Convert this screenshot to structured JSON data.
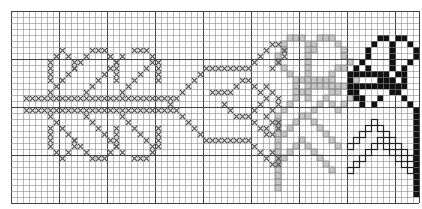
{
  "grid": {
    "cols": 68,
    "rows": 32,
    "cell": 6,
    "bold_every": 8,
    "line_color": "#8a8a8a",
    "bold_color": "#444444",
    "bg": "#ffffff"
  },
  "colors": {
    "cross": "#555555",
    "gray_fill": "#c8c8c8",
    "gray_dark": "#8c8c8c",
    "black": "#111111",
    "outline": "#222222"
  },
  "chart_data": {
    "type": "pattern-grid",
    "title": "",
    "cross_cells": [
      [
        2,
        14
      ],
      [
        3,
        14
      ],
      [
        4,
        14
      ],
      [
        5,
        14
      ],
      [
        6,
        14
      ],
      [
        7,
        14
      ],
      [
        8,
        14
      ],
      [
        9,
        14
      ],
      [
        10,
        14
      ],
      [
        11,
        14
      ],
      [
        12,
        14
      ],
      [
        13,
        14
      ],
      [
        14,
        14
      ],
      [
        15,
        14
      ],
      [
        16,
        14
      ],
      [
        17,
        14
      ],
      [
        18,
        14
      ],
      [
        19,
        14
      ],
      [
        20,
        14
      ],
      [
        21,
        14
      ],
      [
        22,
        14
      ],
      [
        23,
        14
      ],
      [
        24,
        14
      ],
      [
        25,
        14
      ],
      [
        26,
        14
      ],
      [
        2,
        16
      ],
      [
        3,
        16
      ],
      [
        4,
        16
      ],
      [
        5,
        16
      ],
      [
        6,
        16
      ],
      [
        7,
        16
      ],
      [
        8,
        16
      ],
      [
        9,
        16
      ],
      [
        10,
        16
      ],
      [
        11,
        16
      ],
      [
        12,
        16
      ],
      [
        13,
        16
      ],
      [
        14,
        16
      ],
      [
        15,
        16
      ],
      [
        16,
        16
      ],
      [
        17,
        16
      ],
      [
        18,
        16
      ],
      [
        19,
        16
      ],
      [
        20,
        16
      ],
      [
        21,
        16
      ],
      [
        22,
        16
      ],
      [
        23,
        16
      ],
      [
        24,
        16
      ],
      [
        25,
        16
      ],
      [
        26,
        16
      ],
      [
        6,
        13
      ],
      [
        7,
        12
      ],
      [
        8,
        11
      ],
      [
        9,
        10
      ],
      [
        10,
        9
      ],
      [
        11,
        8
      ],
      [
        12,
        7
      ],
      [
        6,
        17
      ],
      [
        7,
        18
      ],
      [
        8,
        19
      ],
      [
        9,
        20
      ],
      [
        10,
        21
      ],
      [
        11,
        22
      ],
      [
        12,
        23
      ],
      [
        6,
        9
      ],
      [
        6,
        10
      ],
      [
        6,
        11
      ],
      [
        6,
        8
      ],
      [
        7,
        7
      ],
      [
        8,
        6
      ],
      [
        9,
        7
      ],
      [
        10,
        8
      ],
      [
        10,
        9
      ],
      [
        6,
        19
      ],
      [
        6,
        20
      ],
      [
        6,
        21
      ],
      [
        6,
        22
      ],
      [
        7,
        23
      ],
      [
        8,
        24
      ],
      [
        9,
        23
      ],
      [
        10,
        22
      ],
      [
        10,
        21
      ],
      [
        12,
        13
      ],
      [
        13,
        12
      ],
      [
        14,
        11
      ],
      [
        15,
        10
      ],
      [
        16,
        9
      ],
      [
        17,
        8
      ],
      [
        18,
        7
      ],
      [
        12,
        17
      ],
      [
        13,
        18
      ],
      [
        14,
        19
      ],
      [
        15,
        20
      ],
      [
        16,
        21
      ],
      [
        17,
        22
      ],
      [
        18,
        23
      ],
      [
        13,
        6
      ],
      [
        14,
        6
      ],
      [
        15,
        6
      ],
      [
        16,
        7
      ],
      [
        17,
        8
      ],
      [
        17,
        9
      ],
      [
        17,
        10
      ],
      [
        17,
        11
      ],
      [
        13,
        24
      ],
      [
        14,
        24
      ],
      [
        15,
        24
      ],
      [
        16,
        23
      ],
      [
        17,
        22
      ],
      [
        17,
        21
      ],
      [
        17,
        20
      ],
      [
        17,
        19
      ],
      [
        18,
        13
      ],
      [
        19,
        12
      ],
      [
        20,
        11
      ],
      [
        21,
        10
      ],
      [
        22,
        9
      ],
      [
        23,
        8
      ],
      [
        18,
        17
      ],
      [
        19,
        18
      ],
      [
        20,
        19
      ],
      [
        21,
        20
      ],
      [
        22,
        21
      ],
      [
        23,
        22
      ],
      [
        20,
        6
      ],
      [
        21,
        6
      ],
      [
        22,
        6
      ],
      [
        23,
        7
      ],
      [
        24,
        8
      ],
      [
        24,
        9
      ],
      [
        24,
        10
      ],
      [
        24,
        11
      ],
      [
        20,
        24
      ],
      [
        21,
        24
      ],
      [
        22,
        24
      ],
      [
        23,
        23
      ],
      [
        24,
        22
      ],
      [
        24,
        21
      ],
      [
        24,
        20
      ],
      [
        24,
        19
      ],
      [
        26,
        15
      ],
      [
        27,
        14
      ],
      [
        28,
        13
      ],
      [
        29,
        12
      ],
      [
        30,
        11
      ],
      [
        31,
        10
      ],
      [
        32,
        9
      ],
      [
        27,
        16
      ],
      [
        28,
        17
      ],
      [
        29,
        18
      ],
      [
        30,
        19
      ],
      [
        31,
        20
      ],
      [
        32,
        21
      ],
      [
        33,
        9
      ],
      [
        34,
        9
      ],
      [
        35,
        9
      ],
      [
        36,
        9
      ],
      [
        37,
        9
      ],
      [
        38,
        9
      ],
      [
        39,
        9
      ],
      [
        40,
        8
      ],
      [
        41,
        7
      ],
      [
        42,
        6
      ],
      [
        43,
        5
      ],
      [
        44,
        5
      ],
      [
        45,
        6
      ],
      [
        45,
        7
      ],
      [
        44,
        8
      ],
      [
        43,
        9
      ],
      [
        33,
        21
      ],
      [
        34,
        21
      ],
      [
        35,
        21
      ],
      [
        36,
        21
      ],
      [
        37,
        21
      ],
      [
        38,
        21
      ],
      [
        39,
        21
      ],
      [
        40,
        22
      ],
      [
        41,
        23
      ],
      [
        42,
        24
      ],
      [
        43,
        25
      ],
      [
        44,
        25
      ],
      [
        44,
        24
      ],
      [
        43,
        23
      ],
      [
        33,
        13
      ],
      [
        34,
        13
      ],
      [
        35,
        13
      ],
      [
        36,
        13
      ],
      [
        37,
        12
      ],
      [
        38,
        11
      ],
      [
        39,
        11
      ],
      [
        40,
        12
      ],
      [
        41,
        13
      ],
      [
        35,
        15
      ],
      [
        36,
        16
      ],
      [
        37,
        17
      ],
      [
        38,
        17
      ],
      [
        39,
        17
      ],
      [
        40,
        16
      ],
      [
        41,
        15
      ],
      [
        42,
        14
      ],
      [
        42,
        12
      ],
      [
        43,
        13
      ],
      [
        44,
        14
      ],
      [
        44,
        15
      ],
      [
        43,
        16
      ],
      [
        42,
        17
      ],
      [
        40,
        18
      ],
      [
        41,
        19
      ],
      [
        42,
        19
      ],
      [
        43,
        18
      ],
      [
        44,
        18
      ],
      [
        44,
        19
      ],
      [
        43,
        20
      ],
      [
        42,
        20
      ]
    ],
    "gray_cells": [
      [
        46,
        4
      ],
      [
        47,
        4
      ],
      [
        48,
        4
      ],
      [
        51,
        4
      ],
      [
        52,
        4
      ],
      [
        53,
        4
      ],
      [
        45,
        5
      ],
      [
        49,
        5
      ],
      [
        50,
        5
      ],
      [
        54,
        5
      ],
      [
        45,
        6
      ],
      [
        49,
        6
      ],
      [
        50,
        6
      ],
      [
        55,
        6
      ],
      [
        44,
        7
      ],
      [
        49,
        7
      ],
      [
        55,
        7
      ],
      [
        44,
        8
      ],
      [
        49,
        8
      ],
      [
        56,
        8
      ],
      [
        45,
        9
      ],
      [
        49,
        9
      ],
      [
        54,
        9
      ],
      [
        55,
        9
      ],
      [
        46,
        10
      ],
      [
        49,
        10
      ],
      [
        53,
        10
      ],
      [
        57,
        10
      ],
      [
        47,
        11
      ],
      [
        48,
        11
      ],
      [
        49,
        11
      ],
      [
        50,
        11
      ],
      [
        51,
        11
      ],
      [
        52,
        11
      ],
      [
        53,
        11
      ],
      [
        57,
        11
      ],
      [
        47,
        12
      ],
      [
        49,
        12
      ],
      [
        50,
        12
      ],
      [
        51,
        12
      ],
      [
        52,
        12
      ],
      [
        53,
        12
      ],
      [
        54,
        12
      ],
      [
        55,
        12
      ],
      [
        47,
        13
      ],
      [
        48,
        13
      ],
      [
        49,
        13
      ],
      [
        53,
        13
      ],
      [
        54,
        13
      ],
      [
        57,
        13
      ],
      [
        47,
        14
      ],
      [
        49,
        14
      ],
      [
        52,
        14
      ],
      [
        56,
        14
      ],
      [
        46,
        15
      ],
      [
        51,
        15
      ],
      [
        53,
        15
      ],
      [
        55,
        15
      ],
      [
        45,
        16
      ],
      [
        50,
        16
      ],
      [
        54,
        16
      ],
      [
        44,
        17
      ],
      [
        44,
        18
      ],
      [
        44,
        19
      ],
      [
        44,
        20
      ],
      [
        44,
        21
      ],
      [
        44,
        22
      ],
      [
        44,
        23
      ],
      [
        44,
        24
      ],
      [
        44,
        25
      ],
      [
        44,
        26
      ],
      [
        44,
        27
      ],
      [
        44,
        28
      ],
      [
        44,
        29
      ],
      [
        48,
        17
      ],
      [
        49,
        17
      ],
      [
        47,
        18
      ],
      [
        50,
        18
      ],
      [
        46,
        19
      ],
      [
        51,
        19
      ],
      [
        45,
        20
      ],
      [
        52,
        20
      ],
      [
        53,
        21
      ],
      [
        54,
        22
      ],
      [
        48,
        21
      ],
      [
        47,
        22
      ],
      [
        49,
        22
      ],
      [
        46,
        23
      ],
      [
        50,
        23
      ],
      [
        45,
        24
      ],
      [
        51,
        24
      ],
      [
        52,
        25
      ],
      [
        53,
        26
      ]
    ],
    "black_cells": [
      [
        61,
        4
      ],
      [
        62,
        4
      ],
      [
        64,
        4
      ],
      [
        65,
        4
      ],
      [
        60,
        5
      ],
      [
        63,
        5
      ],
      [
        66,
        5
      ],
      [
        59,
        6
      ],
      [
        63,
        6
      ],
      [
        67,
        6
      ],
      [
        59,
        7
      ],
      [
        63,
        7
      ],
      [
        67,
        7
      ],
      [
        58,
        8
      ],
      [
        63,
        8
      ],
      [
        66,
        8
      ],
      [
        57,
        9
      ],
      [
        59,
        9
      ],
      [
        63,
        9
      ],
      [
        65,
        9
      ],
      [
        56,
        10
      ],
      [
        57,
        10
      ],
      [
        58,
        10
      ],
      [
        59,
        10
      ],
      [
        60,
        10
      ],
      [
        61,
        10
      ],
      [
        62,
        10
      ],
      [
        64,
        10
      ],
      [
        65,
        10
      ],
      [
        56,
        11
      ],
      [
        61,
        11
      ],
      [
        62,
        11
      ],
      [
        63,
        11
      ],
      [
        65,
        11
      ],
      [
        56,
        12
      ],
      [
        57,
        12
      ],
      [
        58,
        12
      ],
      [
        59,
        12
      ],
      [
        60,
        12
      ],
      [
        61,
        12
      ],
      [
        62,
        12
      ],
      [
        63,
        12
      ],
      [
        64,
        12
      ],
      [
        65,
        12
      ],
      [
        56,
        13
      ],
      [
        57,
        13
      ],
      [
        63,
        13
      ],
      [
        64,
        13
      ],
      [
        57,
        14
      ],
      [
        58,
        14
      ],
      [
        61,
        14
      ],
      [
        65,
        14
      ],
      [
        58,
        15
      ],
      [
        60,
        15
      ],
      [
        66,
        15
      ],
      [
        67,
        16
      ],
      [
        67,
        17
      ],
      [
        67,
        18
      ],
      [
        67,
        19
      ],
      [
        67,
        20
      ],
      [
        67,
        21
      ],
      [
        67,
        22
      ],
      [
        67,
        23
      ],
      [
        67,
        24
      ],
      [
        67,
        25
      ],
      [
        67,
        26
      ],
      [
        67,
        27
      ],
      [
        67,
        28
      ],
      [
        67,
        29
      ],
      [
        67,
        30
      ]
    ],
    "outline_cells": [
      [
        60,
        18
      ],
      [
        59,
        19
      ],
      [
        61,
        19
      ],
      [
        58,
        20
      ],
      [
        62,
        20
      ],
      [
        57,
        21
      ],
      [
        63,
        21
      ],
      [
        56,
        22
      ],
      [
        64,
        22
      ],
      [
        65,
        23
      ],
      [
        66,
        24
      ],
      [
        61,
        21
      ],
      [
        60,
        22
      ],
      [
        62,
        22
      ],
      [
        59,
        23
      ],
      [
        63,
        23
      ],
      [
        58,
        24
      ],
      [
        64,
        24
      ],
      [
        57,
        25
      ],
      [
        65,
        25
      ],
      [
        56,
        26
      ],
      [
        66,
        26
      ]
    ]
  }
}
